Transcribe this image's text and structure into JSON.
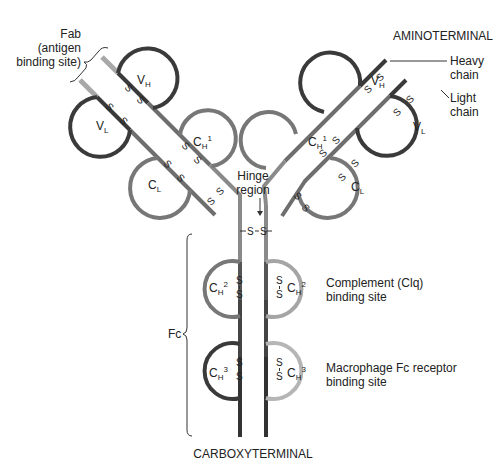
{
  "labels": {
    "fab": [
      "Fab",
      "(antigen",
      "binding site)"
    ],
    "aminoterminal": "AMINOTERMINAL",
    "heavy_chain": [
      "Heavy",
      "chain"
    ],
    "light_chain": [
      "Light",
      "chain"
    ],
    "hinge": [
      "Hinge",
      "region"
    ],
    "complement": [
      "Complement (Clq)",
      "binding site"
    ],
    "macrophage": [
      "Macrophage Fc receptor",
      "binding site"
    ],
    "fc": "Fc",
    "carboxyterminal": "CARBOXYTERMINAL"
  },
  "domains": {
    "vh": {
      "main": "V",
      "sub": "H"
    },
    "vl": {
      "main": "V",
      "sub": "L"
    },
    "ch1": {
      "main": "C",
      "sub": "H",
      "sup": "1"
    },
    "cl": {
      "main": "C",
      "sub": "L"
    },
    "ch2": {
      "main": "C",
      "sub": "H",
      "sup": "2"
    },
    "ch3": {
      "main": "C",
      "sub": "H",
      "sup": "3"
    }
  },
  "bond": "S",
  "hinge_bond": "S – S",
  "colors": {
    "dark": "#3a3a3a",
    "mid": "#6e6e6e",
    "light": "#9a9a9a",
    "pale": "#b5b5b5"
  }
}
